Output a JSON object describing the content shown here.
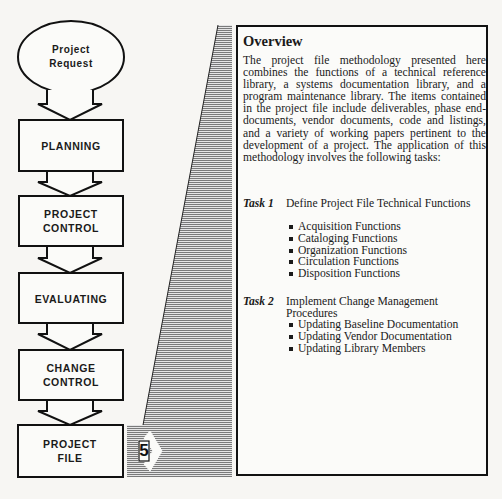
{
  "flowchart": {
    "start": {
      "line1": "Project",
      "line2": "Request"
    },
    "steps": [
      {
        "line1": "PLANNING",
        "line2": ""
      },
      {
        "line1": "PROJECT",
        "line2": "CONTROL"
      },
      {
        "line1": "EVALUATING",
        "line2": ""
      },
      {
        "line1": "CHANGE",
        "line2": "CONTROL"
      },
      {
        "line1": "PROJECT",
        "line2": "FILE"
      }
    ],
    "marker_number": "5",
    "shade_color": "#8a8a8a"
  },
  "panel": {
    "title": "Overview",
    "body": "The project file methodology presented here combines the functions of a technical reference library, a systems documentation library, and a program maintenance library. The items contained in the project file include deliverables, phase end-documents, vendor documents, code and listings, and a variety of working papers pertinent to the development of a project. The application of this methodology involves the following tasks:",
    "tasks": [
      {
        "label": "Task 1",
        "title": "Define Project File Technical Functions",
        "items": [
          "Acquisition Functions",
          "Cataloging Functions",
          "Organization Functions",
          "Circulation Functions",
          "Disposition Functions"
        ]
      },
      {
        "label": "Task 2",
        "title": "Implement Change Management Procedures",
        "items": [
          "Updating Baseline Documentation",
          "Updating Vendor Documentation",
          "Updating Library Members"
        ]
      }
    ]
  }
}
